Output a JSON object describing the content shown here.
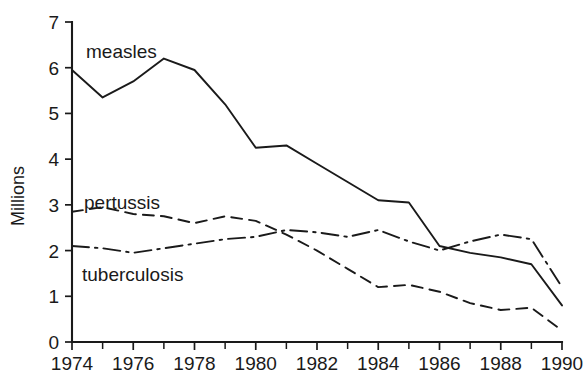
{
  "chart_data": {
    "type": "line",
    "title": "",
    "subtitle": "",
    "xlabel": "",
    "ylabel": "Millions",
    "xlim": [
      1974,
      1990
    ],
    "ylim": [
      0,
      7
    ],
    "grid": false,
    "legend_position": "inline-labels",
    "x": [
      1974,
      1975,
      1976,
      1977,
      1978,
      1979,
      1980,
      1981,
      1982,
      1983,
      1984,
      1985,
      1986,
      1987,
      1988,
      1989,
      1990
    ],
    "y_ticks": [
      "0",
      "1",
      "2",
      "3",
      "4",
      "5",
      "6",
      "7"
    ],
    "x_ticks_major": [
      "1974",
      "1976",
      "1978",
      "1980",
      "1982",
      "1984",
      "1986",
      "1988",
      "1990"
    ],
    "x_ticks_minor": [
      "1975",
      "1977",
      "1979",
      "1981",
      "1983",
      "1985",
      "1987",
      "1989"
    ],
    "series": [
      {
        "name": "measles",
        "label": "measles",
        "style": "solid",
        "color": "#1a1a1a",
        "values": [
          5.95,
          5.35,
          5.7,
          6.2,
          5.95,
          5.2,
          4.25,
          4.3,
          3.9,
          3.5,
          3.1,
          3.05,
          2.1,
          1.95,
          1.85,
          1.7,
          0.8
        ]
      },
      {
        "name": "pertussis",
        "label": "pertussis",
        "style": "dashed",
        "color": "#1a1a1a",
        "values": [
          2.85,
          2.95,
          2.8,
          2.75,
          2.6,
          2.75,
          2.65,
          2.35,
          2.0,
          1.6,
          1.2,
          1.25,
          1.1,
          0.85,
          0.7,
          0.75,
          0.25
        ]
      },
      {
        "name": "tuberculosis",
        "label": "tuberculosis",
        "style": "dash-dot",
        "color": "#1a1a1a",
        "values": [
          2.1,
          2.05,
          1.95,
          2.05,
          2.15,
          2.25,
          2.3,
          2.45,
          2.4,
          2.3,
          2.45,
          2.2,
          2.0,
          2.2,
          2.35,
          2.25,
          1.2
        ]
      }
    ]
  }
}
